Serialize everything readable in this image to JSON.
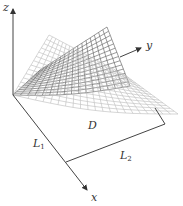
{
  "figure": {
    "axes": {
      "x_label": "x",
      "y_label": "y",
      "z_label": "z"
    },
    "domain_label": "D",
    "side_labels": {
      "l1": {
        "main": "L",
        "sub": "1"
      },
      "l2": {
        "main": "L",
        "sub": "2"
      }
    },
    "colors": {
      "axis": "#444444",
      "mesh_light": "#bbbbbb",
      "mesh_dark": "#555555"
    }
  }
}
